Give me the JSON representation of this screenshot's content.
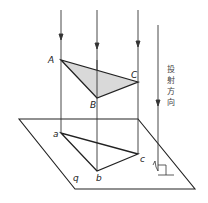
{
  "diagram": {
    "type": "orthographic-projection",
    "labels": {
      "A": "A",
      "B": "B",
      "C": "C",
      "a": "a",
      "b": "b",
      "c": "c",
      "plane": "q"
    },
    "direction_text": [
      "投",
      "射",
      "方",
      "向"
    ],
    "colors": {
      "stroke": "#222222",
      "triangle_fill": "#d9d9d9",
      "background": "#ffffff"
    },
    "points": {
      "A": [
        61,
        60
      ],
      "B": [
        97,
        98
      ],
      "C": [
        138,
        82
      ],
      "a": [
        61,
        133
      ],
      "b": [
        97,
        171
      ],
      "c": [
        138,
        154
      ]
    },
    "plane": [
      [
        19,
        119
      ],
      [
        138,
        119
      ],
      [
        195,
        189
      ],
      [
        75,
        189
      ]
    ]
  }
}
